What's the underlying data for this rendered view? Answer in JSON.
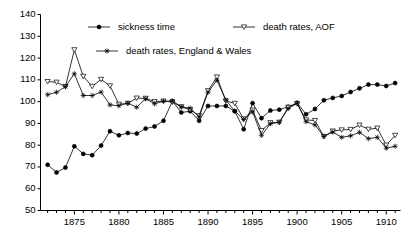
{
  "chart_data": {
    "type": "line",
    "title": "",
    "xlabel": "",
    "ylabel": "",
    "xlim": [
      1871.2,
      1911.6
    ],
    "ylim": [
      50,
      140
    ],
    "ytick_step": 10,
    "yticks": [
      50,
      60,
      70,
      80,
      90,
      100,
      110,
      120,
      130,
      140
    ],
    "xticks": [
      1875,
      1880,
      1885,
      1890,
      1895,
      1900,
      1905,
      1910
    ],
    "xtick_minor_step": 1,
    "grid": false,
    "legend_position": "top-inside",
    "x": [
      1872,
      1873,
      1874,
      1875,
      1876,
      1877,
      1878,
      1879,
      1880,
      1881,
      1882,
      1883,
      1884,
      1885,
      1886,
      1887,
      1888,
      1889,
      1890,
      1891,
      1892,
      1893,
      1894,
      1895,
      1896,
      1897,
      1898,
      1899,
      1900,
      1901,
      1902,
      1903,
      1904,
      1905,
      1906,
      1907,
      1908,
      1909,
      1910,
      1911
    ],
    "series": [
      {
        "name": "sickness time",
        "marker": "filled-circle",
        "color": "#000000",
        "values": [
          71.0,
          67.5,
          69.7,
          79.5,
          76.0,
          75.4,
          79.8,
          86.4,
          84.5,
          85.6,
          85.3,
          87.6,
          88.6,
          91.2,
          100.2,
          95.0,
          95.6,
          91.2,
          98.0,
          98.0,
          98.0,
          95.6,
          87.3,
          99.3,
          92.4,
          95.9,
          96.3,
          97.6,
          99.4,
          94.2,
          96.6,
          100.6,
          101.7,
          102.6,
          104.4,
          106.1,
          107.8,
          107.8,
          107.2,
          108.5
        ]
      },
      {
        "name": "death rates, AOF",
        "marker": "down-triangle",
        "color": "#000000",
        "values": [
          109.2,
          108.9,
          106.9,
          123.8,
          111.6,
          107.0,
          110.2,
          107.2,
          98.8,
          99.2,
          101.6,
          101.5,
          100.0,
          100.2,
          99.8,
          97.6,
          96.2,
          93.5,
          105.0,
          111.3,
          100.3,
          99.2,
          92.0,
          96.1,
          86.7,
          90.3,
          90.5,
          97.4,
          99.0,
          91.6,
          91.3,
          84.0,
          86.5,
          87.0,
          87.2,
          89.2,
          87.3,
          87.8,
          80.0,
          84.5
        ]
      },
      {
        "name": "death rates, England & Wales",
        "marker": "asterisk",
        "color": "#000000",
        "values": [
          103.2,
          104.3,
          106.9,
          112.8,
          102.8,
          102.8,
          104.4,
          98.5,
          98.1,
          99.3,
          97.4,
          101.3,
          99.0,
          100.2,
          100.3,
          97.6,
          97.0,
          93.0,
          104.3,
          109.8,
          100.7,
          95.7,
          91.8,
          95.3,
          84.5,
          89.8,
          90.5,
          96.8,
          99.4,
          90.8,
          89.3,
          84.0,
          86.0,
          83.6,
          84.3,
          85.9,
          83.0,
          83.6,
          78.6,
          79.5
        ]
      }
    ]
  },
  "axis": {
    "y_tick_labels": [
      "140",
      "130",
      "120",
      "110",
      "100",
      "90",
      "80",
      "70",
      "60",
      "50"
    ],
    "x_tick_labels": [
      "1875",
      "1880",
      "1885",
      "1890",
      "1895",
      "1900",
      "1905",
      "1910"
    ]
  },
  "legend": {
    "items": [
      {
        "label": "sickness time",
        "marker": "filled-circle"
      },
      {
        "label": "death rates, AOF",
        "marker": "down-triangle"
      },
      {
        "label": "death rates, England & Wales",
        "marker": "asterisk"
      }
    ]
  },
  "colors": {
    "line": "#000000",
    "axis": "#000000",
    "background": "#ffffff"
  }
}
